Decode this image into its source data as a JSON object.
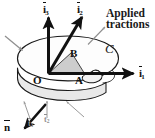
{
  "figure": {
    "background_color": "#ffffff",
    "ink_color": "#111111",
    "leader_color": "#8f8f8f",
    "wedge_fill_color": "#c9c9c9",
    "slab_top_fill": "#fdfdfd",
    "slab_side_fill": "#e8e8e8"
  },
  "basis_vectors": [
    {
      "name": "i1",
      "label_prefix": "i",
      "label_sub": "1",
      "description": "in-plane basis vector pointing right",
      "arrow_color": "#111111"
    },
    {
      "name": "i2",
      "label_prefix": "i",
      "label_sub": "2",
      "description": "in-plane basis vector pointing up-right",
      "arrow_color": "#111111"
    },
    {
      "name": "i3",
      "label_prefix": "i",
      "label_sub": "3",
      "description": "out-of-plane basis vector pointing up",
      "arrow_color": "#111111"
    }
  ],
  "points": [
    {
      "name": "O",
      "label": "O",
      "description": "origin at disk center"
    },
    {
      "name": "A",
      "label": "A",
      "description": "point on cut face along i1"
    },
    {
      "name": "B",
      "label": "B",
      "description": "point above wedge along i2"
    }
  ],
  "curve": {
    "label": "C",
    "description": "script C boundary curve on top face"
  },
  "normal": {
    "label": "n",
    "description": "outward unit normal vector at lower-left"
  },
  "annotations": {
    "applied_tractions": {
      "line1": "Applied",
      "line2": "tractions",
      "description": "callout label with leader line to slab edge"
    }
  },
  "traction_labels": [
    {
      "name": "t-left",
      "label": "t",
      "sub": "1"
    },
    {
      "name": "t-center",
      "label": "t",
      "sub": "2"
    }
  ]
}
